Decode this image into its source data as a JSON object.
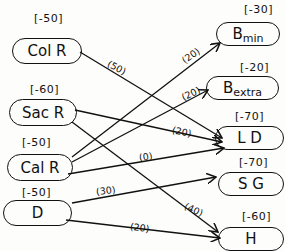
{
  "diagram": {
    "type": "network-flow",
    "sources": [
      {
        "id": "colr",
        "label": "Col R",
        "supply": "[-50]"
      },
      {
        "id": "sacr",
        "label": "Sac R",
        "supply": "[-60]"
      },
      {
        "id": "calr",
        "label": "Cal R",
        "supply": "[-50]"
      },
      {
        "id": "d",
        "label": "D",
        "supply": "[-50]"
      }
    ],
    "sinks": [
      {
        "id": "bmin",
        "label": "B",
        "sub": "min",
        "demand": "[-30]"
      },
      {
        "id": "bextra",
        "label": "B",
        "sub": "extra",
        "demand": "[-20]"
      },
      {
        "id": "ld",
        "label": "L D",
        "demand": "[-70]"
      },
      {
        "id": "sg",
        "label": "S G",
        "demand": "[-70]"
      },
      {
        "id": "h",
        "label": "H",
        "demand": "[-60]"
      }
    ],
    "edges": [
      {
        "from": "colr",
        "to": "ld",
        "label": "(50)"
      },
      {
        "from": "sacr",
        "to": "ld",
        "label": "(20)"
      },
      {
        "from": "sacr",
        "to": "h",
        "label": "(40)"
      },
      {
        "from": "calr",
        "to": "bmin",
        "label": "(20)"
      },
      {
        "from": "calr",
        "to": "bextra",
        "label": "(20)"
      },
      {
        "from": "calr",
        "to": "ld",
        "label": "(0)"
      },
      {
        "from": "d",
        "to": "sg",
        "label": "(30)"
      },
      {
        "from": "d",
        "to": "h",
        "label": "(20)"
      }
    ]
  }
}
